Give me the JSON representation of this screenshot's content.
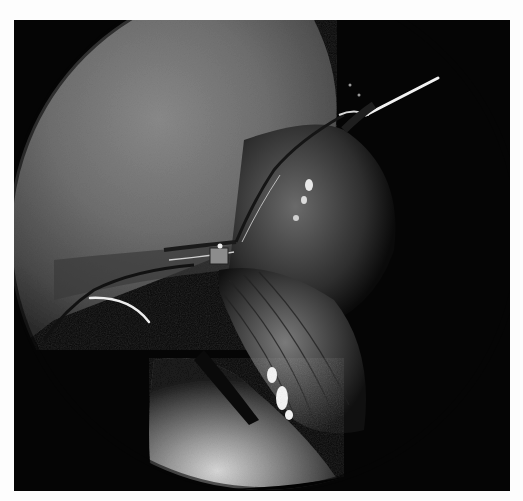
{
  "image": {
    "kind": "grayscale laparoscopic surgical photograph",
    "alt": "Endoscopic view showing liver surface, suture knot at center, needle and instrument shaft",
    "background_color": "#fdfdfd",
    "frame_color": "#050505",
    "elements": {
      "liver_dome": "large gray tissue surface upper-left",
      "suture_knot": "tied suture convergence at center",
      "needle": "curved white needle at left",
      "instrument": "bright laparoscopic instrument shaft upper right",
      "tissue_bundle": "striated tissue with specular highlights center-right",
      "lower_organ": "bright rounded organ surface at bottom"
    }
  }
}
